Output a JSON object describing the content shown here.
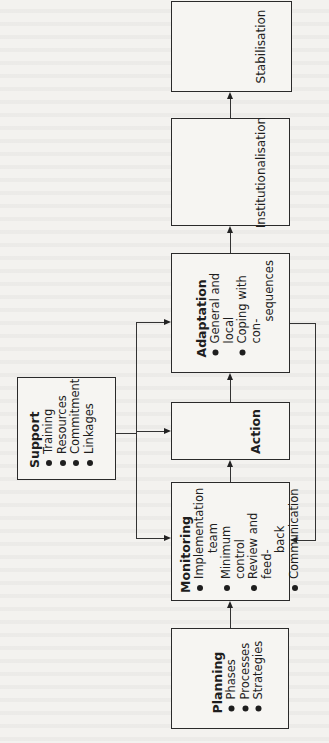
{
  "diagram": {
    "boxes": {
      "stabilisation": {
        "title": "Stabilisation"
      },
      "institutionalisation": {
        "title": "Institutionalisation"
      },
      "adaptation": {
        "title": "Adaptation",
        "items": [
          "General and local",
          "Coping with con-",
          "sequences"
        ]
      },
      "action": {
        "title": "Action"
      },
      "monitoring": {
        "title": "Monitoring",
        "items": [
          "Implementation",
          "team",
          "Minimum control",
          "Review and feed-",
          "back",
          "Communication"
        ]
      },
      "planning": {
        "title": "Planning",
        "items": [
          "Phases",
          "Processes",
          "Strategies"
        ]
      },
      "support": {
        "title": "Support",
        "items": [
          "Training",
          "Resources",
          "Commitment",
          "Linkages"
        ]
      }
    },
    "flow": [
      "Planning",
      "Monitoring",
      "Action",
      "Adaptation",
      "Institutionalisation",
      "Stabilisation"
    ],
    "colors": {
      "line": "#2a2a2a",
      "background": "#f3f2ef"
    }
  }
}
